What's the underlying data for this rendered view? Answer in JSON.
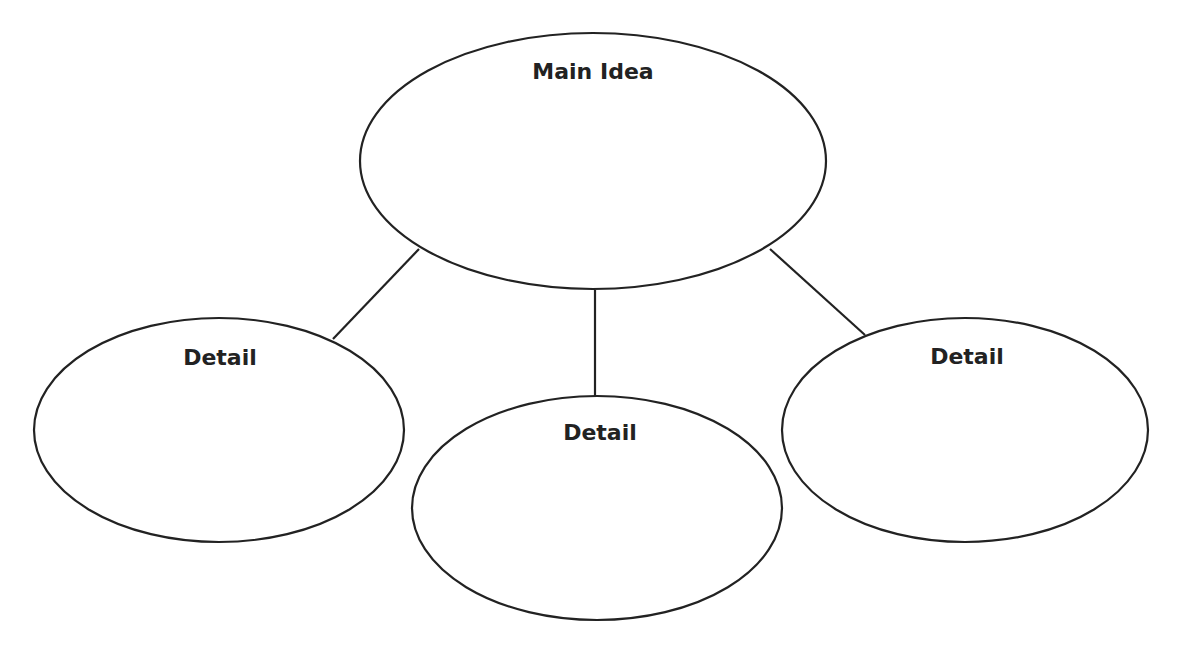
{
  "diagram": {
    "type": "main-idea-and-details web",
    "stroke_color": "#222222",
    "background_color": "#ffffff",
    "main": {
      "label": "Main Idea",
      "cx": 593,
      "cy": 161,
      "rx": 233,
      "ry": 128,
      "label_x": 593,
      "label_y": 79
    },
    "details": [
      {
        "label": "Detail",
        "cx": 219,
        "cy": 430,
        "rx": 185,
        "ry": 112,
        "label_x": 220,
        "label_y": 365
      },
      {
        "label": "Detail",
        "cx": 597,
        "cy": 508,
        "rx": 185,
        "ry": 112,
        "label_x": 600,
        "label_y": 440
      },
      {
        "label": "Detail",
        "cx": 965,
        "cy": 430,
        "rx": 183,
        "ry": 112,
        "label_x": 967,
        "label_y": 364
      }
    ],
    "connectors": [
      {
        "from": "main",
        "to": "detail-left",
        "x1": 419,
        "y1": 249,
        "x2": 333,
        "y2": 339
      },
      {
        "from": "main",
        "to": "detail-center",
        "x1": 595,
        "y1": 290,
        "x2": 595,
        "y2": 396
      },
      {
        "from": "main",
        "to": "detail-right",
        "x1": 770,
        "y1": 249,
        "x2": 865,
        "y2": 335
      }
    ]
  }
}
